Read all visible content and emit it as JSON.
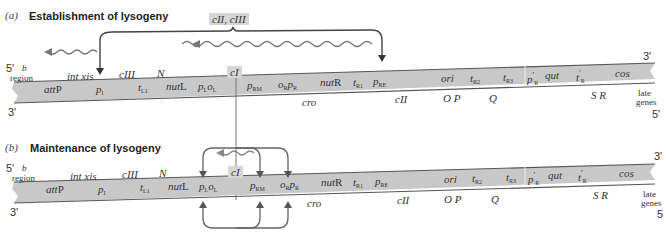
{
  "panels": [
    {
      "letter": "(a)",
      "title": "Establishment of lysogeny",
      "regulator_label": "cII, cIII",
      "strand_5_left": "5'",
      "strand_3_left": "3'",
      "strand_3_right": "3'",
      "strand_5_right": "5'",
      "b_region_b": "b",
      "b_region_region": "region",
      "top_genes": [
        "int xis",
        "cIII",
        "N"
      ],
      "highlight_gene": "cI",
      "band_sites": [
        "attP",
        "p",
        "t",
        "nutL",
        "p",
        "o",
        "p",
        "o",
        "p",
        "nutR",
        "t",
        "p",
        "ori",
        "t",
        "t",
        "p'",
        "qut",
        "t'",
        "cos"
      ],
      "band_subscripts": {
        "pI": "I",
        "tL1": "L1",
        "pL": "L",
        "oL": "L",
        "pRM": "RM",
        "oR": "R",
        "pR": "R",
        "tR1": "R1",
        "pRE": "RE",
        "tR2": "R2",
        "tR3": "R3",
        "pR_prime": "R",
        "tR_prime": "R"
      },
      "bottom_genes": [
        "cro",
        "cII",
        "O P",
        "Q",
        "S R"
      ],
      "late_genes_1": "late",
      "late_genes_2": "genes"
    },
    {
      "letter": "(b)",
      "title": "Maintenance of lysogeny",
      "strand_5_left": "5'",
      "strand_3_left": "3'",
      "strand_3_right": "3'",
      "strand_5_right": "5",
      "b_region_b": "b",
      "b_region_region": "region",
      "top_genes": [
        "int xis",
        "cIII",
        "N"
      ],
      "highlight_gene": "cI",
      "bottom_genes": [
        "cro",
        "cII",
        "O P",
        "Q",
        "S R"
      ],
      "late_genes_1": "late",
      "late_genes_2": "genes"
    }
  ],
  "labels": {
    "attP_a": "att",
    "attP_b": "P",
    "p": "p",
    "t": "t",
    "o": "o",
    "nut": "nut",
    "L": "L",
    "R": "R",
    "ori": "ori",
    "qut": "qut",
    "cos": "cos",
    "sub_I": "I",
    "sub_L1": "L1",
    "sub_L": "L",
    "sub_RM": "RM",
    "sub_R": "R",
    "sub_R1": "R1",
    "sub_RE": "RE",
    "sub_R2": "R2",
    "sub_R3": "R3",
    "prime": "'"
  },
  "colors": {
    "band": "#c8c8c8",
    "band_edge": "#555555",
    "highlight": "#d6d6d6",
    "arrow": "#444444",
    "wavy_arrow": "#777777"
  }
}
